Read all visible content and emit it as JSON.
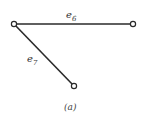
{
  "diagram": {
    "caption": "(a)",
    "nodes": [
      {
        "id": "n1",
        "x": 14,
        "y": 24
      },
      {
        "id": "n2",
        "x": 133,
        "y": 24
      },
      {
        "id": "n3",
        "x": 74,
        "y": 86
      }
    ],
    "edges": [
      {
        "id": "e6",
        "from": "n1",
        "to": "n2",
        "label_base": "e",
        "label_sub": "6"
      },
      {
        "id": "e7",
        "from": "n1",
        "to": "n3",
        "label_base": "e",
        "label_sub": "7"
      }
    ],
    "colors": {
      "stroke": "#2a2a2a",
      "background": "#ffffff"
    }
  }
}
